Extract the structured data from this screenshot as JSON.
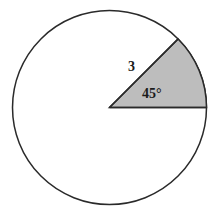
{
  "figure": {
    "kind": "circle-with-shaded-sector",
    "background_color": "#ffffff",
    "stroke_color": "#2a2a2a",
    "sector_fill_color": "#bdbdbd",
    "circle_fill_color": "#ffffff",
    "stroke_width": 1.5,
    "circle": {
      "center_x": 109.5,
      "center_y": 107.5,
      "radius": 97
    },
    "sector": {
      "start_angle_deg": 0,
      "end_angle_deg": 45,
      "radius": 97
    },
    "labels": {
      "radius": "3",
      "angle": "45°"
    }
  },
  "chart_data": {
    "type": "pie",
    "title": "",
    "categories": [
      "Shaded sector",
      "Unshaded remainder"
    ],
    "values": [
      45,
      315
    ],
    "value_unit": "degrees",
    "series": [
      {
        "name": "Central angle (degrees)",
        "values": [
          45,
          315
        ]
      }
    ],
    "annotations": [
      {
        "text": "3",
        "meaning": "radius length",
        "x": 134,
        "y": 68
      },
      {
        "text": "45°",
        "meaning": "central angle of shaded sector",
        "x": 155,
        "y": 94
      }
    ],
    "legend": "none",
    "grid": false
  }
}
